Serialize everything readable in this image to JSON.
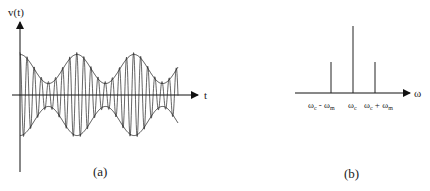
{
  "panel_a": {
    "y_label": "v(t)",
    "x_label": "t",
    "caption": "(a)",
    "description": "AM waveform: carrier modulated by sinusoidal envelope"
  },
  "panel_b": {
    "x_label": "ω",
    "caption": "(b)",
    "lines": [
      {
        "label": "ωc - ωm",
        "relative_height": 0.5
      },
      {
        "label": "ωc",
        "relative_height": 1.0
      },
      {
        "label": "ωc + ωm",
        "relative_height": 0.5
      }
    ],
    "tick_labels": {
      "lower": {
        "main": "ω",
        "sub1": "c",
        "sep": " - ",
        "main2": "ω",
        "sub2": "m"
      },
      "center": {
        "main": "ω",
        "sub1": "c"
      },
      "upper": {
        "main": "ω",
        "sub1": "c",
        "sep": " + ",
        "main2": "ω",
        "sub2": "m"
      }
    }
  },
  "colors": {
    "stroke": "#1a1a1a",
    "background": "#ffffff"
  }
}
